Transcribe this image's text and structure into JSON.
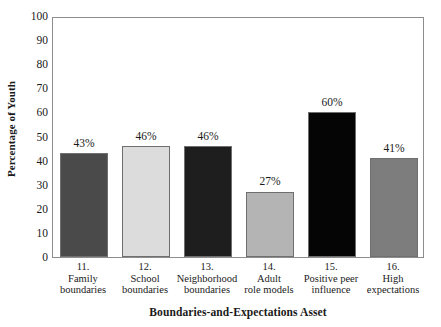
{
  "chart_data": {
    "type": "bar",
    "title": "",
    "xlabel": "Boundaries-and-Expectations Asset",
    "ylabel": "Percentage of Youth",
    "ylim": [
      0,
      100
    ],
    "ytick_step": 10,
    "yticks": [
      100,
      90,
      80,
      70,
      60,
      50,
      40,
      30,
      20,
      10,
      0
    ],
    "grid": false,
    "legend": "none",
    "categories": [
      "11. Family boundaries",
      "12. School boundaries",
      "13. Neighborhood boundaries",
      "14. Adult role models",
      "15. Positive peer influence",
      "16. High expectations"
    ],
    "category_numbers": [
      "11.",
      "12.",
      "13.",
      "14.",
      "15.",
      "16."
    ],
    "category_lines": [
      [
        "Family",
        "boundaries"
      ],
      [
        "School",
        "boundaries"
      ],
      [
        "Neighborhood",
        "boundaries"
      ],
      [
        "Adult",
        "role models"
      ],
      [
        "Positive peer",
        "influence"
      ],
      [
        "High",
        "expectations"
      ]
    ],
    "values": [
      43,
      46,
      46,
      27,
      60,
      41
    ],
    "value_labels": [
      "43%",
      "46%",
      "46%",
      "27%",
      "60%",
      "41%"
    ],
    "bar_colors": [
      "#4a4a4a",
      "#dcdcdc",
      "#1e1e1e",
      "#b4b4b4",
      "#050505",
      "#7d7d7d"
    ],
    "bar_border_color": "#6f6f6f",
    "frame_color": "#8d8d8d",
    "background": "#ffffff",
    "text_color": "#1a1a1a"
  }
}
